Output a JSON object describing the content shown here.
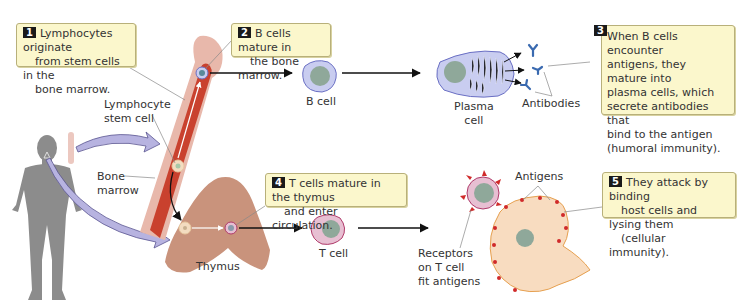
{
  "callouts": [
    {
      "number": "1",
      "lines": [
        "Lymphocytes originate",
        "from stem cells in the",
        "bone marrow."
      ]
    },
    {
      "number": "2",
      "lines": [
        "B cells mature in",
        "the bone marrow."
      ]
    },
    {
      "number": "3",
      "lines": [
        "When B cells encounter",
        "antigens, they mature into",
        "plasma cells, which",
        "secrete antibodies that",
        "bind to the antigen",
        " (humoral immunity)."
      ]
    },
    {
      "number": "4",
      "lines": [
        "T cells mature in the thymus",
        "and enter circulation."
      ]
    },
    {
      "number": "5",
      "lines": [
        "They attack by binding",
        "host cells and lysing them",
        "(cellular immunity)."
      ]
    }
  ],
  "labels": {
    "lymphocyte_stem_cell": [
      "Lymphocyte",
      "stem cell"
    ],
    "bone_marrow": [
      "Bone",
      "marrow"
    ],
    "b_cell": "B cell",
    "plasma_cell": [
      "Plasma",
      "cell"
    ],
    "antibodies": "Antibodies",
    "thymus": "Thymus",
    "t_cell": "T cell",
    "receptors": [
      "Receptors",
      "on T cell",
      "fit antigens"
    ],
    "antigens": "Antigens"
  },
  "colors": {
    "callout_bg": "#fbf7cc",
    "body_gray": "#8c8c8c",
    "bone_outer": "#e8b8ab",
    "marrow_red": "#c9412e",
    "b_cell_fill": "#c9cdf0",
    "b_cell_border": "#6a6fc4",
    "nucleus": "#8fa89a",
    "t_cell_fill": "#e7bfd2",
    "t_cell_border": "#b03a6a",
    "thymus": "#c9937c",
    "host_cell": "#f8dcc0",
    "antigen_red": "#d02a2a",
    "arrow_purple": "#b7b3e0"
  }
}
